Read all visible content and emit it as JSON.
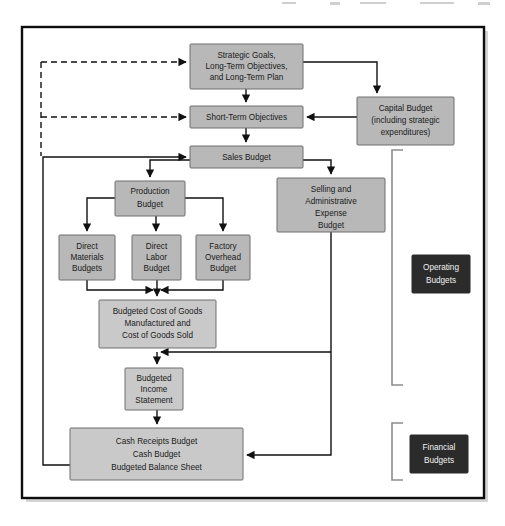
{
  "figure": {
    "type": "flowchart",
    "background_color": "#ffffff",
    "frame_color": "#0d0d0d",
    "box_fill": "#b8b8b8",
    "box_fill_light": "#c9c9c9",
    "box_stroke": "#6e6e6e",
    "label_box_fill": "#2b2b2b",
    "label_text_color": "#f2f2f2",
    "connector_color": "#111111",
    "bracket_color": "#8d8d8d"
  },
  "nodes": [
    {
      "id": "strategic-goals",
      "name": "strategic-goals-box",
      "lines": [
        "Strategic Goals,",
        "Long-Term Objectives,",
        "and Long-Term Plan"
      ],
      "x": 190,
      "y": 44,
      "w": 113,
      "h": 45
    },
    {
      "id": "capital-budget",
      "name": "capital-budget-box",
      "lines": [
        "Capital Budget",
        "(including strategic",
        "expenditures)"
      ],
      "x": 357,
      "y": 97,
      "w": 97,
      "h": 48
    },
    {
      "id": "short-term-objectives",
      "name": "short-term-objectives-box",
      "lines": [
        "Short-Term Objectives"
      ],
      "x": 190,
      "y": 106,
      "w": 113,
      "h": 22
    },
    {
      "id": "sales-budget",
      "name": "sales-budget-box",
      "lines": [
        "Sales Budget"
      ],
      "x": 190,
      "y": 146,
      "w": 113,
      "h": 22
    },
    {
      "id": "production-budget",
      "name": "production-budget-box",
      "lines": [
        "Production",
        "Budget"
      ],
      "x": 115,
      "y": 181,
      "w": 70,
      "h": 35
    },
    {
      "id": "selling-admin-budget",
      "name": "selling-administrative-expense-budget-box",
      "lines": [
        "Selling and",
        "Administrative",
        "Expense",
        "Budget"
      ],
      "x": 277,
      "y": 178,
      "w": 108,
      "h": 54
    },
    {
      "id": "direct-materials",
      "name": "direct-materials-budgets-box",
      "lines": [
        "Direct",
        "Materials",
        "Budgets"
      ],
      "x": 59,
      "y": 235,
      "w": 56,
      "h": 45
    },
    {
      "id": "direct-labor",
      "name": "direct-labor-budget-box",
      "lines": [
        "Direct",
        "Labor",
        "Budget"
      ],
      "x": 132,
      "y": 235,
      "w": 49,
      "h": 45
    },
    {
      "id": "factory-overhead",
      "name": "factory-overhead-budget-box",
      "lines": [
        "Factory",
        "Overhead",
        "Budget"
      ],
      "x": 196,
      "y": 235,
      "w": 54,
      "h": 45
    },
    {
      "id": "budgeted-cogm",
      "name": "budgeted-cost-of-goods-box",
      "lines": [
        "Budgeted Cost of Goods",
        "Manufactured and",
        "Cost of Goods Sold"
      ],
      "x": 99,
      "y": 300,
      "w": 117,
      "h": 48
    },
    {
      "id": "budgeted-income-statement",
      "name": "budgeted-income-statement-box",
      "lines": [
        "Budgeted",
        "Income",
        "Statement"
      ],
      "x": 125,
      "y": 368,
      "w": 58,
      "h": 42
    },
    {
      "id": "cash-budgets",
      "name": "cash-budgets-box",
      "lines": [
        "Cash Receipts Budget",
        "Cash Budget",
        "Budgeted Balance Sheet"
      ],
      "x": 70,
      "y": 428,
      "w": 173,
      "h": 52
    }
  ],
  "group_labels": [
    {
      "id": "operating-budgets",
      "name": "operating-budgets-label",
      "lines": [
        "Operating",
        "Budgets"
      ],
      "x": 412,
      "y": 255,
      "w": 58,
      "h": 38,
      "bracket": {
        "x": 392,
        "y_top": 150,
        "y_bottom": 385,
        "arm": 11
      }
    },
    {
      "id": "financial-budgets",
      "name": "financial-budgets-label",
      "lines": [
        "Financial",
        "Budgets"
      ],
      "x": 410,
      "y": 435,
      "w": 58,
      "h": 38,
      "bracket": {
        "x": 392,
        "y_top": 423,
        "y_bottom": 480,
        "arm": 11
      }
    }
  ],
  "connectors": [
    {
      "name": "feedback-to-strategic-goals",
      "style": "dashed",
      "from": "feedback-trunk",
      "to": "strategic-goals"
    },
    {
      "name": "feedback-to-short-term-objectives",
      "style": "dashed",
      "from": "feedback-trunk",
      "to": "short-term-objectives"
    },
    {
      "name": "cash-budgets-to-sales-budget",
      "style": "solid",
      "from": "cash-budgets",
      "to": "sales-budget"
    },
    {
      "name": "strategic-goals-to-short-term-objectives",
      "style": "solid",
      "from": "strategic-goals",
      "to": "short-term-objectives"
    },
    {
      "name": "strategic-goals-to-capital-budget",
      "style": "solid",
      "from": "strategic-goals",
      "to": "capital-budget"
    },
    {
      "name": "capital-budget-to-short-term-objectives",
      "style": "solid",
      "from": "capital-budget",
      "to": "short-term-objectives"
    },
    {
      "name": "short-term-objectives-to-sales-budget",
      "style": "solid",
      "from": "short-term-objectives",
      "to": "sales-budget"
    },
    {
      "name": "sales-budget-to-production-budget",
      "style": "solid",
      "from": "sales-budget",
      "to": "production-budget"
    },
    {
      "name": "sales-budget-to-selling-admin-budget",
      "style": "solid",
      "from": "sales-budget",
      "to": "selling-admin-budget"
    },
    {
      "name": "production-budget-to-direct-materials",
      "style": "solid",
      "from": "production-budget",
      "to": "direct-materials"
    },
    {
      "name": "production-budget-to-direct-labor",
      "style": "solid",
      "from": "production-budget",
      "to": "direct-labor"
    },
    {
      "name": "production-budget-to-factory-overhead",
      "style": "solid",
      "from": "production-budget",
      "to": "factory-overhead"
    },
    {
      "name": "direct-materials-to-budgeted-cogm",
      "style": "solid",
      "from": "direct-materials",
      "to": "budgeted-cogm"
    },
    {
      "name": "direct-labor-to-budgeted-cogm",
      "style": "solid",
      "from": "direct-labor",
      "to": "budgeted-cogm"
    },
    {
      "name": "factory-overhead-to-budgeted-cogm",
      "style": "solid",
      "from": "factory-overhead",
      "to": "budgeted-cogm"
    },
    {
      "name": "selling-admin-budget-to-budgeted-cogm",
      "style": "solid",
      "from": "selling-admin-budget",
      "to": "budgeted-cogm"
    },
    {
      "name": "budgeted-cogm-to-income-statement",
      "style": "solid",
      "from": "budgeted-cogm",
      "to": "budgeted-income-statement"
    },
    {
      "name": "income-statement-to-cash-budgets",
      "style": "solid",
      "from": "budgeted-income-statement",
      "to": "cash-budgets"
    },
    {
      "name": "selling-admin-budget-to-cash-budgets",
      "style": "solid",
      "from": "selling-admin-budget",
      "to": "cash-budgets"
    }
  ]
}
